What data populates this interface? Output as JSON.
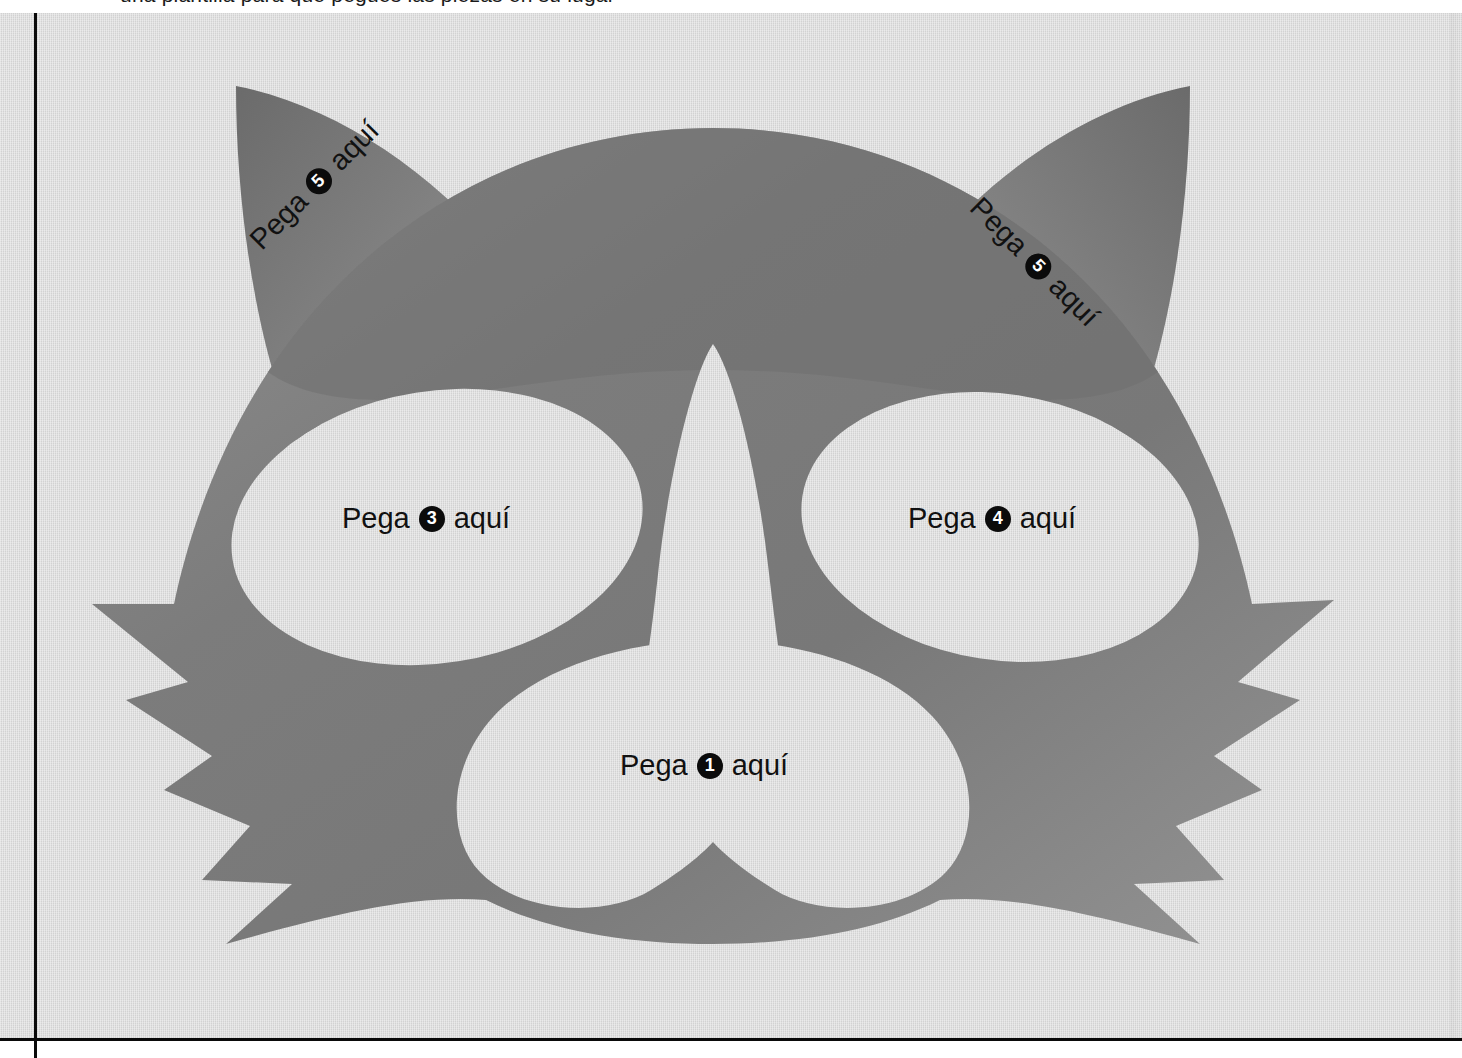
{
  "document": {
    "title": "Plantilla máscara de gato",
    "language": "es",
    "clipped_top_line": "una plantilla para que pegues las piezas en su lugar"
  },
  "colors": {
    "paper": "#d8d8d8",
    "fur_dark": "#6e6e6e",
    "fur_light": "#a0a0a0",
    "cutout_white": "#ffffff",
    "rule_line": "#0a0a0a",
    "badge_fill": "#0b0b0b",
    "badge_text": "#ffffff",
    "label_text": "#111111"
  },
  "labels": [
    {
      "id": "nose",
      "prefix": "Pega",
      "number": "1",
      "suffix": "aquí",
      "rotation": 0,
      "region": "muzzle"
    },
    {
      "id": "eye-l",
      "prefix": "Pega",
      "number": "3",
      "suffix": "aquí",
      "rotation": 0,
      "region": "left-eye"
    },
    {
      "id": "eye-r",
      "prefix": "Pega",
      "number": "4",
      "suffix": "aquí",
      "rotation": 0,
      "region": "right-eye"
    },
    {
      "id": "ear-l",
      "prefix": "Pega",
      "number": "5",
      "suffix": "aquí",
      "rotation": -45,
      "region": "left-ear"
    },
    {
      "id": "ear-r",
      "prefix": "Pega",
      "number": "5",
      "suffix": "aquí",
      "rotation": 45,
      "region": "right-ear"
    }
  ],
  "artwork": {
    "subject": "cat-face-mask-template",
    "parts": [
      "left-ear",
      "right-ear",
      "head",
      "left-eye-cutout",
      "right-eye-cutout",
      "nose-bridge-cutout",
      "muzzle-cutout",
      "fur-spikes"
    ]
  },
  "rules": {
    "vertical_label": "fold-line-vertical",
    "horizontal_label": "fold-line-horizontal"
  }
}
